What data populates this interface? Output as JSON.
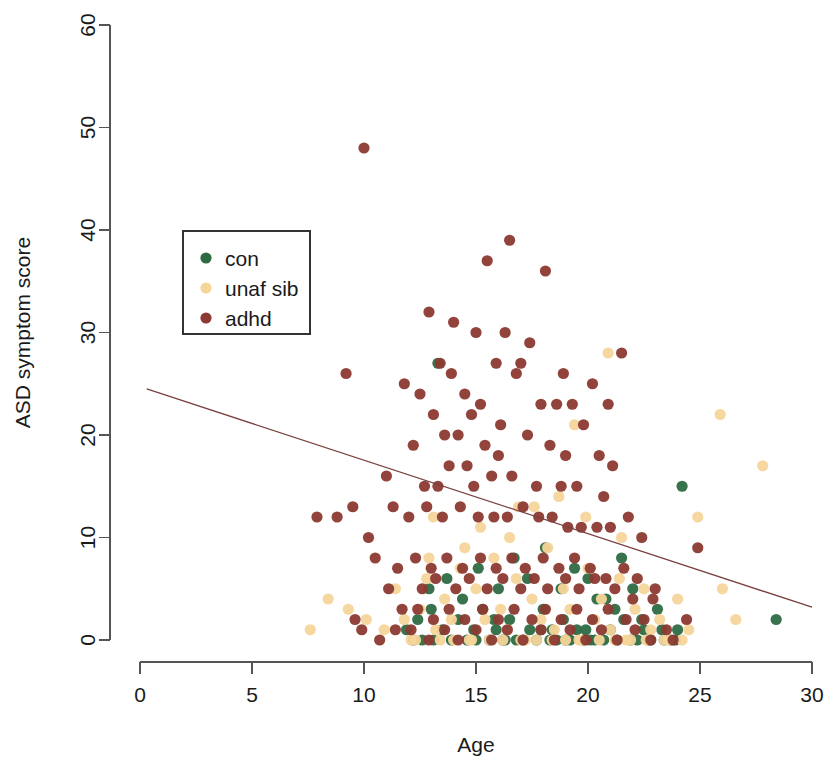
{
  "chart_data": {
    "type": "scatter",
    "title": "",
    "xlabel": "Age",
    "ylabel": "ASD symptom score",
    "xlim": [
      0,
      30
    ],
    "ylim": [
      0,
      60
    ],
    "xticks": [
      0,
      5,
      10,
      15,
      20,
      25,
      30
    ],
    "yticks": [
      0,
      10,
      20,
      30,
      40,
      50,
      60
    ],
    "grid": false,
    "legend_position": "upper-left-inside",
    "legend": [
      {
        "label": "con",
        "color": "#2e6b43"
      },
      {
        "label": "unaf sib",
        "color": "#f5d59a"
      },
      {
        "label": "adhd",
        "color": "#8c3a32"
      }
    ],
    "series": [
      {
        "name": "con",
        "color": "#2e6b43",
        "points": [
          [
            12.2,
            0
          ],
          [
            12.6,
            0
          ],
          [
            13.1,
            0
          ],
          [
            13.5,
            1
          ],
          [
            13.9,
            0
          ],
          [
            14.2,
            2
          ],
          [
            14.6,
            0
          ],
          [
            15.0,
            0
          ],
          [
            15.3,
            3
          ],
          [
            15.6,
            0
          ],
          [
            15.9,
            1
          ],
          [
            16.2,
            0
          ],
          [
            16.5,
            2
          ],
          [
            16.8,
            0
          ],
          [
            17.1,
            0
          ],
          [
            17.4,
            1
          ],
          [
            17.7,
            0
          ],
          [
            18.0,
            3
          ],
          [
            18.3,
            0
          ],
          [
            18.6,
            0
          ],
          [
            18.9,
            2
          ],
          [
            19.2,
            0
          ],
          [
            19.5,
            1
          ],
          [
            19.8,
            0
          ],
          [
            20.1,
            0
          ],
          [
            20.4,
            4
          ],
          [
            20.7,
            0
          ],
          [
            21.0,
            1
          ],
          [
            21.3,
            0
          ],
          [
            21.6,
            2
          ],
          [
            21.9,
            0
          ],
          [
            22.2,
            0
          ],
          [
            22.5,
            1
          ],
          [
            22.8,
            0
          ],
          [
            23.1,
            3
          ],
          [
            23.4,
            0
          ],
          [
            23.7,
            0
          ],
          [
            24.0,
            1
          ],
          [
            12.9,
            5
          ],
          [
            13.7,
            6
          ],
          [
            14.4,
            4
          ],
          [
            15.1,
            7
          ],
          [
            16.0,
            5
          ],
          [
            16.7,
            8
          ],
          [
            17.3,
            6
          ],
          [
            18.1,
            9
          ],
          [
            18.8,
            5
          ],
          [
            19.4,
            7
          ],
          [
            20.0,
            6
          ],
          [
            20.8,
            4
          ],
          [
            21.5,
            8
          ],
          [
            22.0,
            5
          ],
          [
            13.3,
            27
          ],
          [
            24.2,
            15
          ],
          [
            28.4,
            2
          ],
          [
            11.9,
            1
          ],
          [
            12.4,
            2
          ],
          [
            14.9,
            1
          ],
          [
            17.9,
            1
          ],
          [
            19.0,
            0
          ],
          [
            19.9,
            1
          ],
          [
            22.7,
            0
          ],
          [
            23.9,
            0
          ],
          [
            13.0,
            3
          ],
          [
            15.8,
            2
          ],
          [
            16.3,
            0
          ],
          [
            18.4,
            1
          ],
          [
            20.3,
            0
          ],
          [
            21.2,
            3
          ],
          [
            22.4,
            2
          ],
          [
            23.3,
            1
          ]
        ]
      },
      {
        "name": "unaf sib",
        "color": "#f5d59a",
        "points": [
          [
            7.6,
            1
          ],
          [
            8.4,
            4
          ],
          [
            9.3,
            3
          ],
          [
            10.1,
            2
          ],
          [
            10.9,
            1
          ],
          [
            11.4,
            5
          ],
          [
            11.8,
            2
          ],
          [
            12.1,
            0
          ],
          [
            12.5,
            3
          ],
          [
            12.8,
            6
          ],
          [
            13.2,
            1
          ],
          [
            13.6,
            4
          ],
          [
            13.9,
            2
          ],
          [
            14.3,
            7
          ],
          [
            14.7,
            0
          ],
          [
            15.0,
            5
          ],
          [
            15.4,
            2
          ],
          [
            15.8,
            8
          ],
          [
            16.1,
            3
          ],
          [
            16.4,
            1
          ],
          [
            16.8,
            6
          ],
          [
            17.2,
            0
          ],
          [
            17.5,
            4
          ],
          [
            17.9,
            2
          ],
          [
            18.2,
            9
          ],
          [
            18.5,
            1
          ],
          [
            18.9,
            5
          ],
          [
            19.2,
            3
          ],
          [
            19.6,
            0
          ],
          [
            20.0,
            7
          ],
          [
            20.3,
            2
          ],
          [
            20.6,
            4
          ],
          [
            21.0,
            1
          ],
          [
            21.4,
            6
          ],
          [
            21.7,
            0
          ],
          [
            22.1,
            3
          ],
          [
            22.5,
            5
          ],
          [
            22.8,
            1
          ],
          [
            23.2,
            2
          ],
          [
            23.6,
            0
          ],
          [
            24.0,
            4
          ],
          [
            24.5,
            1
          ],
          [
            25.9,
            22
          ],
          [
            26.6,
            2
          ],
          [
            27.8,
            17
          ],
          [
            26.0,
            5
          ],
          [
            24.9,
            12
          ],
          [
            12.3,
            0
          ],
          [
            13.4,
            0
          ],
          [
            14.0,
            0
          ],
          [
            14.8,
            0
          ],
          [
            15.6,
            0
          ],
          [
            16.2,
            0
          ],
          [
            17.0,
            0
          ],
          [
            17.7,
            0
          ],
          [
            18.4,
            0
          ],
          [
            19.0,
            0
          ],
          [
            19.7,
            0
          ],
          [
            20.5,
            0
          ],
          [
            21.2,
            0
          ],
          [
            21.9,
            0
          ],
          [
            22.6,
            0
          ],
          [
            23.4,
            0
          ],
          [
            24.2,
            0
          ],
          [
            13.1,
            12
          ],
          [
            15.2,
            11
          ],
          [
            16.9,
            13
          ],
          [
            18.7,
            14
          ],
          [
            19.9,
            12
          ],
          [
            21.5,
            10
          ],
          [
            20.9,
            28
          ],
          [
            19.4,
            21
          ],
          [
            17.6,
            13
          ],
          [
            16.5,
            10
          ],
          [
            14.5,
            9
          ],
          [
            12.9,
            8
          ]
        ]
      },
      {
        "name": "adhd",
        "color": "#8c3a32",
        "points": [
          [
            10.0,
            48
          ],
          [
            16.5,
            39
          ],
          [
            15.5,
            37
          ],
          [
            18.1,
            36
          ],
          [
            12.9,
            32
          ],
          [
            14.0,
            31
          ],
          [
            15.0,
            30
          ],
          [
            16.3,
            30
          ],
          [
            17.4,
            29
          ],
          [
            21.5,
            28
          ],
          [
            9.2,
            26
          ],
          [
            13.4,
            27
          ],
          [
            15.9,
            27
          ],
          [
            17.0,
            27
          ],
          [
            11.8,
            25
          ],
          [
            13.9,
            26
          ],
          [
            16.8,
            26
          ],
          [
            18.9,
            26
          ],
          [
            20.2,
            25
          ],
          [
            12.5,
            24
          ],
          [
            14.5,
            24
          ],
          [
            15.2,
            23
          ],
          [
            17.9,
            23
          ],
          [
            18.6,
            23
          ],
          [
            19.3,
            23
          ],
          [
            20.9,
            23
          ],
          [
            13.1,
            22
          ],
          [
            14.8,
            22
          ],
          [
            16.1,
            21
          ],
          [
            19.8,
            21
          ],
          [
            11.0,
            16
          ],
          [
            12.2,
            19
          ],
          [
            13.6,
            20
          ],
          [
            14.2,
            20
          ],
          [
            15.4,
            19
          ],
          [
            16.0,
            18
          ],
          [
            17.3,
            20
          ],
          [
            18.3,
            19
          ],
          [
            19.0,
            18
          ],
          [
            20.5,
            18
          ],
          [
            21.1,
            17
          ],
          [
            13.8,
            17
          ],
          [
            14.6,
            17
          ],
          [
            15.7,
            16
          ],
          [
            16.6,
            16
          ],
          [
            12.7,
            15
          ],
          [
            13.3,
            15
          ],
          [
            14.9,
            15
          ],
          [
            17.7,
            15
          ],
          [
            18.8,
            15
          ],
          [
            19.5,
            15
          ],
          [
            20.7,
            14
          ],
          [
            7.9,
            12
          ],
          [
            8.8,
            12
          ],
          [
            9.5,
            13
          ],
          [
            11.3,
            13
          ],
          [
            12.0,
            12
          ],
          [
            12.8,
            13
          ],
          [
            13.5,
            12
          ],
          [
            14.3,
            13
          ],
          [
            15.1,
            12
          ],
          [
            15.8,
            12
          ],
          [
            16.4,
            12
          ],
          [
            17.1,
            13
          ],
          [
            17.8,
            12
          ],
          [
            18.4,
            12
          ],
          [
            19.1,
            11
          ],
          [
            19.7,
            11
          ],
          [
            20.4,
            11
          ],
          [
            21.0,
            11
          ],
          [
            21.8,
            12
          ],
          [
            22.4,
            10
          ],
          [
            24.9,
            9
          ],
          [
            10.5,
            8
          ],
          [
            11.5,
            7
          ],
          [
            12.3,
            8
          ],
          [
            13.0,
            7
          ],
          [
            13.7,
            8
          ],
          [
            14.4,
            7
          ],
          [
            15.2,
            8
          ],
          [
            15.9,
            7
          ],
          [
            16.6,
            8
          ],
          [
            17.2,
            7
          ],
          [
            18.0,
            8
          ],
          [
            18.7,
            7
          ],
          [
            19.4,
            8
          ],
          [
            20.1,
            7
          ],
          [
            20.8,
            6
          ],
          [
            21.6,
            7
          ],
          [
            22.2,
            6
          ],
          [
            23.0,
            5
          ],
          [
            11.1,
            5
          ],
          [
            12.6,
            5
          ],
          [
            13.2,
            6
          ],
          [
            14.1,
            5
          ],
          [
            14.7,
            6
          ],
          [
            15.5,
            5
          ],
          [
            16.2,
            6
          ],
          [
            17.0,
            5
          ],
          [
            17.6,
            6
          ],
          [
            18.2,
            5
          ],
          [
            19.0,
            6
          ],
          [
            19.6,
            5
          ],
          [
            20.3,
            6
          ],
          [
            21.2,
            5
          ],
          [
            22.0,
            4
          ],
          [
            22.9,
            4
          ],
          [
            11.7,
            3
          ],
          [
            12.4,
            3
          ],
          [
            13.1,
            2
          ],
          [
            13.8,
            3
          ],
          [
            14.5,
            2
          ],
          [
            15.3,
            3
          ],
          [
            16.0,
            2
          ],
          [
            16.7,
            3
          ],
          [
            17.5,
            2
          ],
          [
            18.1,
            3
          ],
          [
            18.8,
            2
          ],
          [
            19.5,
            3
          ],
          [
            20.2,
            2
          ],
          [
            20.9,
            3
          ],
          [
            21.7,
            2
          ],
          [
            22.5,
            2
          ],
          [
            12.1,
            1
          ],
          [
            12.9,
            0
          ],
          [
            13.6,
            1
          ],
          [
            14.2,
            0
          ],
          [
            15.0,
            1
          ],
          [
            15.7,
            0
          ],
          [
            16.4,
            1
          ],
          [
            17.1,
            0
          ],
          [
            17.9,
            1
          ],
          [
            18.5,
            0
          ],
          [
            19.2,
            1
          ],
          [
            19.9,
            0
          ],
          [
            20.6,
            1
          ],
          [
            21.3,
            0
          ],
          [
            22.1,
            1
          ],
          [
            22.8,
            0
          ],
          [
            23.5,
            1
          ],
          [
            9.9,
            1
          ],
          [
            10.7,
            0
          ],
          [
            11.4,
            1
          ],
          [
            10.2,
            10
          ],
          [
            9.6,
            2
          ],
          [
            23.8,
            0
          ],
          [
            24.4,
            2
          ]
        ]
      }
    ],
    "fit_line": {
      "color": "#7a4040",
      "x_start": 0.3,
      "y_start": 24.5,
      "x_end": 30.0,
      "y_end": 3.2,
      "note": "linear regression trend line, negative slope"
    }
  }
}
